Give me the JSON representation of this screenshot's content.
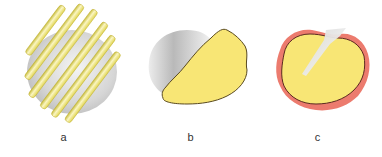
{
  "figure": {
    "panels": [
      {
        "id": "a",
        "label": "a",
        "description": "rods-over-sphere"
      },
      {
        "id": "b",
        "label": "b",
        "description": "yellow-patch-on-cup"
      },
      {
        "id": "c",
        "label": "c",
        "description": "yellow-disc-with-red-rim"
      }
    ]
  },
  "colors": {
    "yellow_fill": "#f8e675",
    "rod_yellow": "#ece26a",
    "rod_highlight": "#fbf6c2",
    "outline": "#5a4a20",
    "gray_shadow": "#c8c8c8",
    "red_rim": "#ec7b6e"
  }
}
